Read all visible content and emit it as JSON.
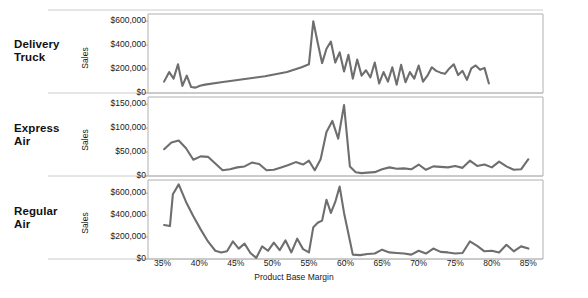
{
  "chart_data": {
    "type": "line",
    "title": "",
    "xlabel": "Product Base Margin",
    "ylabel": "Sales",
    "grid": false,
    "legend_position": "none",
    "layout": "small-multiples-vertical",
    "x_tick_labels": [
      "35%",
      "40%",
      "45%",
      "50%",
      "55%",
      "60%",
      "65%",
      "70%",
      "75%",
      "80%",
      "85%"
    ],
    "x_tick_values": [
      35,
      40,
      45,
      50,
      55,
      60,
      65,
      70,
      75,
      80,
      85
    ],
    "xlim": [
      33,
      87
    ],
    "panels": [
      {
        "name": "Delivery Truck",
        "label": "Delivery\nTruck",
        "ylabel": "Sales",
        "ylim": [
          0,
          660000
        ],
        "y_tick_labels": [
          "$0",
          "$200,000",
          "$400,000",
          "$600,000"
        ],
        "y_tick_values": [
          0,
          200000,
          400000,
          600000
        ],
        "line_color": "#6e6e6e",
        "x": [
          35.2,
          35.9,
          36.5,
          37.1,
          37.7,
          38.3,
          38.9,
          39.5,
          40.1,
          40.8,
          43.0,
          46.0,
          49.0,
          52.0,
          54.0,
          55.0,
          55.6,
          56.2,
          56.8,
          57.4,
          58.0,
          58.6,
          59.2,
          59.8,
          60.4,
          61.0,
          61.6,
          62.2,
          62.8,
          63.4,
          64.0,
          64.6,
          65.2,
          65.8,
          66.4,
          67.0,
          67.6,
          68.2,
          68.8,
          69.4,
          70.0,
          70.6,
          71.2,
          71.8,
          72.4,
          73.0,
          73.6,
          74.2,
          74.8,
          75.4,
          76.0,
          76.6,
          77.2,
          77.8,
          78.4,
          79.0,
          79.6
        ],
        "y": [
          95000,
          175000,
          120000,
          240000,
          60000,
          145000,
          50000,
          45000,
          60000,
          70000,
          90000,
          115000,
          140000,
          175000,
          215000,
          240000,
          600000,
          420000,
          250000,
          370000,
          430000,
          255000,
          340000,
          180000,
          320000,
          120000,
          280000,
          145000,
          190000,
          130000,
          255000,
          80000,
          175000,
          95000,
          215000,
          70000,
          235000,
          90000,
          175000,
          120000,
          230000,
          95000,
          145000,
          215000,
          185000,
          170000,
          160000,
          205000,
          240000,
          150000,
          185000,
          110000,
          205000,
          230000,
          195000,
          210000,
          80000
        ]
      },
      {
        "name": "Express Air",
        "label": "Express\nAir",
        "ylabel": "Sales",
        "ylim": [
          0,
          165000
        ],
        "y_tick_labels": [
          "$0",
          "$50,000",
          "$100,000",
          "$150,000"
        ],
        "y_tick_values": [
          0,
          50000,
          100000,
          150000
        ],
        "line_color": "#6e6e6e",
        "x": [
          35.2,
          36.2,
          37.2,
          38.2,
          39.2,
          40.2,
          41.2,
          42.2,
          43.2,
          44.2,
          45.2,
          46.2,
          47.2,
          48.2,
          49.2,
          50.2,
          51.2,
          52.2,
          53.2,
          54.2,
          55.0,
          55.8,
          56.6,
          57.4,
          58.2,
          59.0,
          59.8,
          60.6,
          61.4,
          62.2,
          63.0,
          64.0,
          65.0,
          66.0,
          67.0,
          68.0,
          69.0,
          70.0,
          71.0,
          72.0,
          73.0,
          74.0,
          75.0,
          76.0,
          77.0,
          78.0,
          79.0,
          80.0,
          81.0,
          82.0,
          83.0,
          84.0,
          85.0
        ],
        "y": [
          56000,
          70000,
          74000,
          58000,
          34000,
          41000,
          40000,
          26000,
          12000,
          14000,
          18000,
          20000,
          28000,
          25000,
          12000,
          13000,
          18000,
          23000,
          29000,
          24000,
          32000,
          12000,
          35000,
          92000,
          115000,
          78000,
          148000,
          20000,
          8000,
          6000,
          7000,
          8000,
          14000,
          18000,
          15000,
          16000,
          14000,
          24000,
          13000,
          20000,
          19000,
          18000,
          21000,
          17000,
          32000,
          21000,
          24000,
          18000,
          30000,
          20000,
          13000,
          14000,
          35000
        ]
      },
      {
        "name": "Regular Air",
        "label": "Regular\nAir",
        "ylabel": "Sales",
        "ylim": [
          0,
          720000
        ],
        "y_tick_labels": [
          "$0",
          "$200,000",
          "$400,000",
          "$600,000"
        ],
        "y_tick_values": [
          0,
          200000,
          400000,
          600000
        ],
        "line_color": "#6e6e6e",
        "x": [
          35.2,
          36.0,
          36.4,
          37.2,
          38.2,
          39.2,
          40.2,
          41.2,
          42.2,
          43.0,
          43.8,
          44.6,
          45.4,
          46.2,
          47.0,
          47.8,
          48.6,
          49.4,
          50.2,
          51.0,
          51.8,
          52.6,
          53.4,
          54.2,
          55.0,
          55.6,
          56.2,
          56.8,
          57.4,
          58.0,
          58.6,
          59.2,
          59.8,
          60.4,
          61.0,
          62.0,
          63.0,
          64.0,
          65.0,
          66.0,
          67.0,
          68.0,
          69.0,
          70.0,
          71.0,
          72.0,
          73.0,
          74.0,
          75.0,
          76.0,
          77.0,
          78.0,
          79.0,
          80.0,
          81.0,
          82.0,
          83.0,
          84.0,
          85.0
        ],
        "y": [
          310000,
          300000,
          590000,
          680000,
          520000,
          390000,
          270000,
          160000,
          75000,
          60000,
          70000,
          160000,
          95000,
          140000,
          55000,
          10000,
          115000,
          75000,
          150000,
          80000,
          170000,
          60000,
          185000,
          90000,
          60000,
          290000,
          330000,
          350000,
          540000,
          420000,
          520000,
          660000,
          420000,
          230000,
          40000,
          35000,
          45000,
          50000,
          85000,
          60000,
          55000,
          50000,
          40000,
          75000,
          50000,
          95000,
          65000,
          60000,
          50000,
          55000,
          160000,
          120000,
          70000,
          75000,
          60000,
          130000,
          70000,
          115000,
          95000
        ]
      }
    ]
  },
  "style": {
    "line_color": "#6e6e6e",
    "axis_color": "#b0b0b0",
    "separator_color": "#cccccc",
    "background": "#ffffff"
  }
}
